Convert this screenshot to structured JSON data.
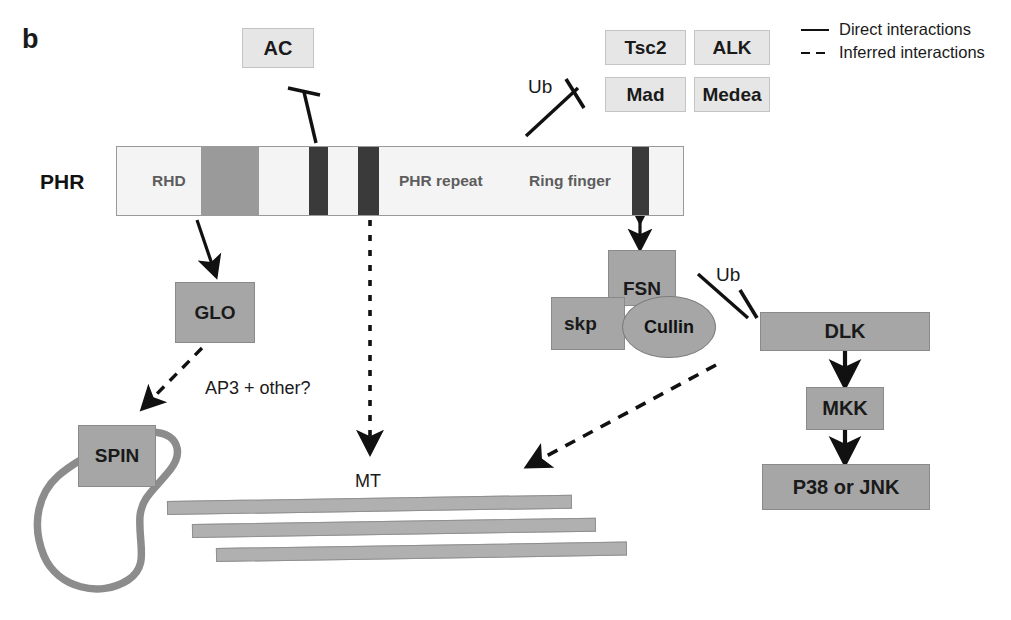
{
  "figure": {
    "panel_letter": "b"
  },
  "legend": {
    "items": [
      {
        "style": "solid",
        "label": "Direct interactions"
      },
      {
        "style": "dashed",
        "label": "Inferred interactions"
      }
    ]
  },
  "protein_bar": {
    "name": "PHR",
    "domains": [
      {
        "label": "RHD"
      },
      {
        "label": "PHR repeat"
      },
      {
        "label": "Ring finger"
      }
    ]
  },
  "nodes": {
    "ac": "AC",
    "tsc2": "Tsc2",
    "alk": "ALK",
    "mad": "Mad",
    "medea": "Medea",
    "glo": "GLO",
    "spin": "SPIN",
    "fsn": "FSN",
    "skp": "skp",
    "cullin": "Cullin",
    "dlk": "DLK",
    "mkk": "MKK",
    "p38_jnk": "P38 or JNK"
  },
  "annotations": {
    "ub_left": "Ub",
    "ub_right": "Ub",
    "ap3": "AP3 + other?",
    "mt": "MT"
  },
  "colors": {
    "box_light": "#e6e6e6",
    "box_gray": "#a6a6a6",
    "bar_background": "#f4f4f4",
    "bar_mid_gray": "#9a9a9a",
    "bar_dark": "#3a3a3a",
    "microtubule": "#b0b0b0",
    "spin_loop": "#8c8c8c",
    "line": "#111111"
  }
}
